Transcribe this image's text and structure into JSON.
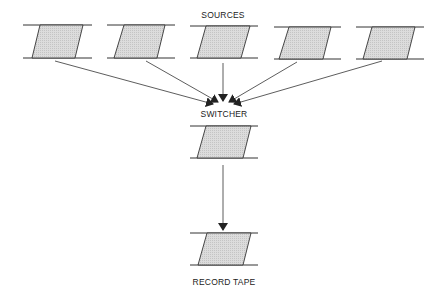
{
  "labels": {
    "sources": "SOURCES",
    "switcher": "SWITCHER",
    "record_tape": "RECORD TAPE"
  },
  "colors": {
    "line": "#333333",
    "fill": "#d6d6d6"
  },
  "nodes": {
    "sources": [
      {
        "id": "source-1"
      },
      {
        "id": "source-2"
      },
      {
        "id": "source-3"
      },
      {
        "id": "source-4"
      },
      {
        "id": "source-5"
      }
    ],
    "switcher": {
      "id": "switcher"
    },
    "record_tape": {
      "id": "record-tape"
    }
  },
  "edges": [
    {
      "from": "source-1",
      "to": "switcher"
    },
    {
      "from": "source-2",
      "to": "switcher"
    },
    {
      "from": "source-3",
      "to": "switcher"
    },
    {
      "from": "source-4",
      "to": "switcher"
    },
    {
      "from": "source-5",
      "to": "switcher"
    },
    {
      "from": "switcher",
      "to": "record-tape"
    }
  ]
}
